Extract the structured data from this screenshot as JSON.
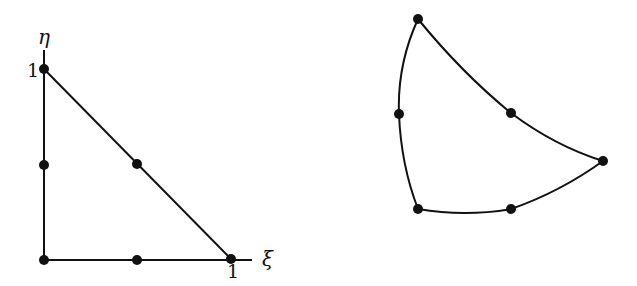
{
  "figure": {
    "left": {
      "title": "Parent element (reference triangle)",
      "axis_labels": {
        "x": "ξ",
        "y": "η"
      },
      "tick_labels": {
        "x_one": "1",
        "y_one": "1"
      },
      "nodes": [
        {
          "x": 44,
          "y": 260
        },
        {
          "x": 137,
          "y": 260
        },
        {
          "x": 231,
          "y": 259
        },
        {
          "x": 137,
          "y": 164
        },
        {
          "x": 44,
          "y": 69
        },
        {
          "x": 44,
          "y": 165
        }
      ]
    },
    "right": {
      "title": "Mapped curved element",
      "nodes": [
        {
          "x": 418,
          "y": 209
        },
        {
          "x": 511,
          "y": 209
        },
        {
          "x": 603,
          "y": 161
        },
        {
          "x": 511,
          "y": 113
        },
        {
          "x": 418,
          "y": 19
        },
        {
          "x": 399,
          "y": 114
        }
      ]
    },
    "colors": {
      "stroke": "#111111",
      "background": "#ffffff"
    }
  }
}
